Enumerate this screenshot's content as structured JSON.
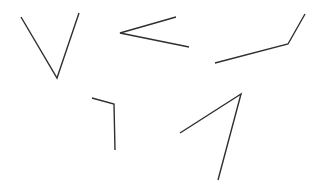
{
  "figure": {
    "width": 317,
    "height": 185,
    "background_color": "#ffffff",
    "stroke_color": "#2e2e35",
    "stroke_width": 1.3
  },
  "shapes": [
    {
      "name": "v-angle-top-left",
      "label": "V shape",
      "vertex": [
        57,
        78
      ],
      "points": "21,17 57,78 79,13",
      "color": "#2e2e35",
      "stroke_width": 1.4
    },
    {
      "name": "less-than-angle-top-center",
      "label": "Less-than shape",
      "vertex": [
        120,
        33
      ],
      "points": "176,17 120,33 189,47",
      "color": "#2e2e35",
      "stroke_width": 1.4
    },
    {
      "name": "obtuse-angle-top-right",
      "label": "Obtuse angle opening left",
      "vertex": [
        288,
        44
      ],
      "points": "215,63 288,44 305,14",
      "color": "#2e2e35",
      "stroke_width": 1.4
    },
    {
      "name": "right-angle-bottom-left",
      "label": "Right angle shape",
      "vertex": [
        114,
        104
      ],
      "points": "92,98 114,104 115,150",
      "color": "#2e2e35",
      "stroke_width": 1.4
    },
    {
      "name": "acute-angle-bottom-right",
      "label": "Acute angle shape",
      "vertex": [
        241,
        94
      ],
      "points": "180,133 241,94 218,180",
      "color": "#2e2e35",
      "stroke_width": 1.4
    }
  ]
}
